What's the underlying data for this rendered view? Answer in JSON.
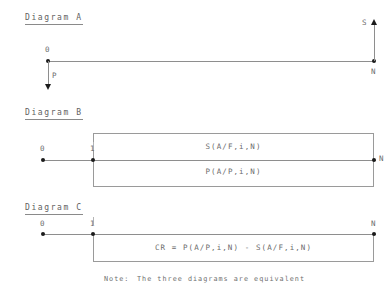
{
  "diagrams": [
    {
      "title": "Diagram A",
      "nodes": [
        {
          "label": "0"
        },
        {
          "label": "N"
        }
      ],
      "arrows": [
        {
          "label": "P",
          "direction": "down"
        },
        {
          "label": "S",
          "direction": "up"
        }
      ]
    },
    {
      "title": "Diagram B",
      "nodes": [
        {
          "label": "0"
        },
        {
          "label": "1"
        },
        {
          "label": "N"
        }
      ],
      "formulas": [
        {
          "text": "S(A/F,i,N)",
          "position": "above"
        },
        {
          "text": "P(A/P,i,N)",
          "position": "below"
        }
      ]
    },
    {
      "title": "Diagram C",
      "nodes": [
        {
          "label": "0"
        },
        {
          "label": "1"
        },
        {
          "label": "N"
        }
      ],
      "formulas": [
        {
          "text": "CR = P(A/P,i,N) - S(A/F,i,N)",
          "position": "below"
        }
      ]
    }
  ],
  "note": {
    "prefix": "Note:",
    "text": "The three diagrams are equivalent"
  },
  "colors": {
    "line": "#8e8e8e",
    "node": "#1b1b1b",
    "text": "#6b6b6b",
    "box": "#9a9a9a"
  }
}
